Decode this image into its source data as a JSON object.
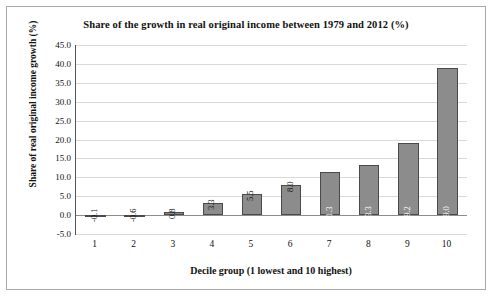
{
  "chart_data": {
    "type": "bar",
    "title": "Share of the growth in real original income between 1979 and 2012 (%)",
    "xlabel": "Decile group (1 lowest and 10 highest)",
    "ylabel": "Share of real original income growth (%)",
    "categories": [
      "1",
      "2",
      "3",
      "4",
      "5",
      "6",
      "7",
      "8",
      "9",
      "10"
    ],
    "values": [
      -0.1,
      -0.6,
      0.8,
      3.3,
      5.5,
      8.0,
      11.3,
      13.3,
      19.2,
      39.0
    ],
    "value_labels": [
      "-0.1",
      "-0.6",
      "0.8",
      "3.3",
      "5.5",
      "8.0",
      "11.3",
      "13.3",
      "19.2",
      "39.0"
    ],
    "ylim": [
      -5.0,
      45.0
    ],
    "ytick_labels": [
      "45.0",
      "40.0",
      "35.0",
      "30.0",
      "25.0",
      "20.0",
      "15.0",
      "10.0",
      "5.0",
      "0.0",
      "-5.0"
    ],
    "ytick_values": [
      45,
      40,
      35,
      30,
      25,
      20,
      15,
      10,
      5,
      0,
      -5
    ],
    "grid": true,
    "legend": null,
    "bar_color": "#8c8c8c",
    "bar_border_color": "#4a4a4a",
    "grid_color": "#d9d9d9",
    "axis_color": "#555555",
    "frame_color": "#a8a8a8"
  }
}
